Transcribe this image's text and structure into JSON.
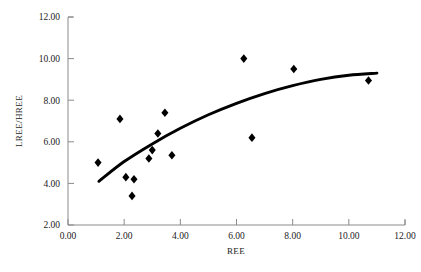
{
  "chart_data": {
    "type": "scatter",
    "title": "",
    "xlabel": "REE",
    "ylabel": "LREE/HREE",
    "xlim": [
      0.0,
      12.0
    ],
    "ylim": [
      2.0,
      12.0
    ],
    "xticks": [
      "0.00",
      "2.00",
      "4.00",
      "6.00",
      "8.00",
      "10.00",
      "12.00"
    ],
    "yticks": [
      "2.00",
      "4.00",
      "6.00",
      "8.00",
      "10.00",
      "12.00"
    ],
    "grid": false,
    "legend": "none",
    "marker_style": "filled-diamond",
    "marker_color": "#000000",
    "points": [
      {
        "x": 1.07,
        "y": 5.0
      },
      {
        "x": 1.85,
        "y": 7.1
      },
      {
        "x": 2.06,
        "y": 4.3
      },
      {
        "x": 2.28,
        "y": 3.4
      },
      {
        "x": 2.35,
        "y": 4.2
      },
      {
        "x": 2.88,
        "y": 5.2
      },
      {
        "x": 3.0,
        "y": 5.6
      },
      {
        "x": 3.2,
        "y": 6.4
      },
      {
        "x": 3.45,
        "y": 7.4
      },
      {
        "x": 3.7,
        "y": 5.35
      },
      {
        "x": 6.26,
        "y": 10.0
      },
      {
        "x": 6.55,
        "y": 6.2
      },
      {
        "x": 8.04,
        "y": 9.5
      },
      {
        "x": 10.7,
        "y": 8.95
      }
    ],
    "trendline": {
      "style": "solid",
      "color": "#000000",
      "description": "fitted concave-down trend curve",
      "points": [
        {
          "x": 1.1,
          "y": 4.1
        },
        {
          "x": 2.0,
          "y": 5.05
        },
        {
          "x": 3.0,
          "y": 5.9
        },
        {
          "x": 4.0,
          "y": 6.65
        },
        {
          "x": 5.0,
          "y": 7.3
        },
        {
          "x": 6.0,
          "y": 7.85
        },
        {
          "x": 7.0,
          "y": 8.32
        },
        {
          "x": 8.0,
          "y": 8.7
        },
        {
          "x": 9.0,
          "y": 9.0
        },
        {
          "x": 10.0,
          "y": 9.2
        },
        {
          "x": 11.0,
          "y": 9.3
        }
      ]
    }
  },
  "axes": {
    "x_title": "REE",
    "y_title": "LREE/HREE",
    "x_tick_labels": [
      "0.00",
      "2.00",
      "4.00",
      "6.00",
      "8.00",
      "10.00",
      "12.00"
    ],
    "y_tick_labels": [
      "2.00",
      "4.00",
      "6.00",
      "8.00",
      "10.00",
      "12.00"
    ]
  }
}
